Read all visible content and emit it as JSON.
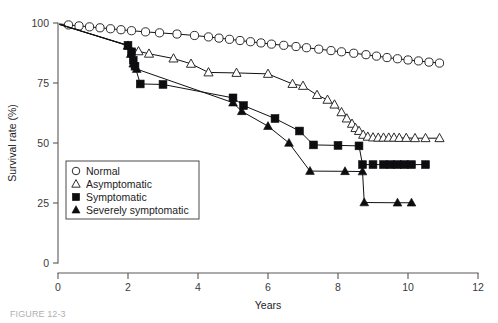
{
  "figure": {
    "caption_partial": "FIGURE 12-3"
  },
  "chart_data": {
    "type": "line",
    "title": "",
    "xlabel": "Years",
    "ylabel": "Survival rate (%)",
    "xlim": [
      0,
      12
    ],
    "ylim": [
      0,
      100
    ],
    "xticks": [
      0,
      2,
      4,
      6,
      8,
      10,
      12
    ],
    "yticks": [
      0,
      25,
      50,
      75,
      100
    ],
    "xtick_labels": [
      "0",
      "2",
      "4",
      "6",
      "8",
      "10",
      "12"
    ],
    "ytick_labels": [
      "0",
      "25",
      "50",
      "75",
      "100"
    ],
    "grid": false,
    "legend_position": "lower-left-inside",
    "series": [
      {
        "name": "Normal",
        "marker": "open-circle",
        "points": [
          [
            0.05,
            99.6
          ],
          [
            0.3,
            99.2
          ],
          [
            0.6,
            98.8
          ],
          [
            0.9,
            98.4
          ],
          [
            1.2,
            98.0
          ],
          [
            1.5,
            97.6
          ],
          [
            1.8,
            97.2
          ],
          [
            2.1,
            96.8
          ],
          [
            2.5,
            96.3
          ],
          [
            2.9,
            95.9
          ],
          [
            3.4,
            95.4
          ],
          [
            3.9,
            94.8
          ],
          [
            4.3,
            94.2
          ],
          [
            4.6,
            93.7
          ],
          [
            4.9,
            93.2
          ],
          [
            5.2,
            92.7
          ],
          [
            5.5,
            92.2
          ],
          [
            5.8,
            91.7
          ],
          [
            6.1,
            91.2
          ],
          [
            6.45,
            90.7
          ],
          [
            6.8,
            90.2
          ],
          [
            7.1,
            89.7
          ],
          [
            7.45,
            89.1
          ],
          [
            7.8,
            88.5
          ],
          [
            8.1,
            88.0
          ],
          [
            8.45,
            87.4
          ],
          [
            8.8,
            86.8
          ],
          [
            9.1,
            86.2
          ],
          [
            9.4,
            85.6
          ],
          [
            9.7,
            85.1
          ],
          [
            10.0,
            84.6
          ],
          [
            10.3,
            84.2
          ],
          [
            10.6,
            83.7
          ],
          [
            10.9,
            83.3
          ]
        ]
      },
      {
        "name": "Asymptomatic",
        "marker": "open-triangle",
        "points": [
          [
            0.05,
            99.5
          ],
          [
            2.0,
            90.5
          ],
          [
            2.3,
            88.2
          ],
          [
            2.6,
            87.2
          ],
          [
            3.3,
            85.2
          ],
          [
            3.8,
            83.0
          ],
          [
            4.3,
            79.4
          ],
          [
            5.1,
            79.2
          ],
          [
            6.0,
            78.8
          ],
          [
            6.7,
            74.6
          ],
          [
            7.0,
            73.8
          ],
          [
            7.4,
            70.0
          ],
          [
            7.7,
            68.0
          ],
          [
            7.9,
            66.0
          ],
          [
            8.1,
            62.8
          ],
          [
            8.25,
            60.2
          ],
          [
            8.4,
            58.0
          ],
          [
            8.5,
            56.2
          ],
          [
            8.6,
            55.0
          ],
          [
            8.72,
            53.4
          ],
          [
            8.85,
            52.6
          ],
          [
            9.0,
            52.3
          ],
          [
            9.15,
            52.2
          ],
          [
            9.3,
            52.2
          ],
          [
            9.45,
            52.2
          ],
          [
            9.6,
            52.2
          ],
          [
            9.75,
            52.1
          ],
          [
            9.95,
            52.1
          ],
          [
            10.2,
            52.0
          ],
          [
            10.5,
            52.0
          ],
          [
            10.9,
            52.0
          ]
        ]
      },
      {
        "name": "Symptomatic",
        "marker": "filled-square",
        "points": [
          [
            0.05,
            99.4
          ],
          [
            2.0,
            90.7
          ],
          [
            2.1,
            88.0
          ],
          [
            2.15,
            84.5
          ],
          [
            2.2,
            82.0
          ],
          [
            2.35,
            74.6
          ],
          [
            3.0,
            74.4
          ],
          [
            5.0,
            68.8
          ],
          [
            5.3,
            65.6
          ],
          [
            6.2,
            60.2
          ],
          [
            6.9,
            55.0
          ],
          [
            7.3,
            49.2
          ],
          [
            8.0,
            49.0
          ],
          [
            8.6,
            48.8
          ],
          [
            8.7,
            41.0
          ],
          [
            9.0,
            41.0
          ],
          [
            9.3,
            41.0
          ],
          [
            9.5,
            41.0
          ],
          [
            9.7,
            41.0
          ],
          [
            9.9,
            41.0
          ],
          [
            10.1,
            41.0
          ],
          [
            10.5,
            41.0
          ]
        ]
      },
      {
        "name": "Severely symptomatic",
        "marker": "filled-triangle",
        "points": [
          [
            0.05,
            99.3
          ],
          [
            2.0,
            90.6
          ],
          [
            2.08,
            87.0
          ],
          [
            2.15,
            83.0
          ],
          [
            2.25,
            80.8
          ],
          [
            5.0,
            66.8
          ],
          [
            5.25,
            63.2
          ],
          [
            6.0,
            57.0
          ],
          [
            6.6,
            50.0
          ],
          [
            7.2,
            38.3
          ],
          [
            8.2,
            38.2
          ],
          [
            8.7,
            38.1
          ],
          [
            8.75,
            25.2
          ],
          [
            9.7,
            25.1
          ],
          [
            10.1,
            25.1
          ]
        ]
      }
    ],
    "legend_entries": [
      {
        "label": "Normal",
        "marker": "open-circle"
      },
      {
        "label": "Asymptomatic",
        "marker": "open-triangle"
      },
      {
        "label": "Symptomatic",
        "marker": "filled-square"
      },
      {
        "label": "Severely symptomatic",
        "marker": "filled-triangle"
      }
    ]
  }
}
